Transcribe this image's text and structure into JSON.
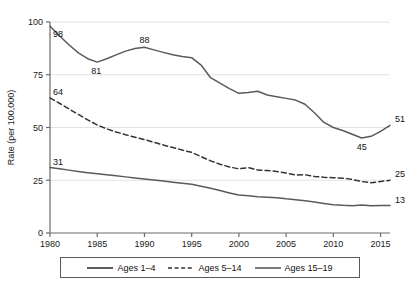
{
  "chart_data": {
    "type": "line",
    "title": "",
    "xlabel": "",
    "ylabel": "Rate (per 100,000)",
    "xlim": [
      1980,
      2016
    ],
    "ylim": [
      0,
      100
    ],
    "grid": true,
    "legend_position": "bottom",
    "x_ticks": [
      "1980",
      "1985",
      "1990",
      "1995",
      "2000",
      "2005",
      "2010",
      "2015"
    ],
    "x_tick_values": [
      1980,
      1985,
      1990,
      1995,
      2000,
      2005,
      2010,
      2015
    ],
    "y_ticks": [
      "0",
      "25",
      "50",
      "75",
      "100"
    ],
    "y_tick_values": [
      0,
      25,
      50,
      75,
      100
    ],
    "x": [
      1980,
      1981,
      1982,
      1983,
      1984,
      1985,
      1986,
      1987,
      1988,
      1989,
      1990,
      1991,
      1992,
      1993,
      1994,
      1995,
      1996,
      1997,
      1998,
      1999,
      2000,
      2001,
      2002,
      2003,
      2004,
      2005,
      2006,
      2007,
      2008,
      2009,
      2010,
      2011,
      2012,
      2013,
      2014,
      2015,
      2016
    ],
    "series": [
      {
        "name": "Ages 1–4",
        "style": "solid",
        "color": "#5a5a5a",
        "values": [
          31,
          30.4,
          29.8,
          29.2,
          28.6,
          28.1,
          27.6,
          27.1,
          26.6,
          26.1,
          25.6,
          25.1,
          24.6,
          24.1,
          23.6,
          23.1,
          22.2,
          21.2,
          20.1,
          19.0,
          18.0,
          17.7,
          17.2,
          17.0,
          16.7,
          16.2,
          15.8,
          15.3,
          14.7,
          14.0,
          13.4,
          13.1,
          12.9,
          13.3,
          12.9,
          13.0,
          13
        ]
      },
      {
        "name": "Ages 5–14",
        "style": "dashed",
        "color": "#333333",
        "values": [
          64,
          61.5,
          58.8,
          56.2,
          53.6,
          51.2,
          49.4,
          47.9,
          46.6,
          45.4,
          44.3,
          43.0,
          41.7,
          40.5,
          39.3,
          38.2,
          36.2,
          34.2,
          32.6,
          31.3,
          30.4,
          31.0,
          29.8,
          29.6,
          29.2,
          28.4,
          27.5,
          27.6,
          26.8,
          26.4,
          26.2,
          26.0,
          25.4,
          24.4,
          23.8,
          24.4,
          25
        ]
      },
      {
        "name": "Ages 15–19",
        "style": "solid",
        "color": "#5a5a5a",
        "values": [
          98,
          93.5,
          89.2,
          85.4,
          82.6,
          81,
          82.6,
          84.4,
          86.2,
          87.4,
          88,
          86.8,
          85.6,
          84.5,
          83.6,
          83.1,
          79.6,
          73.6,
          71.0,
          68.4,
          66.2,
          66.6,
          67.2,
          65.4,
          64.6,
          63.8,
          63.0,
          61.0,
          57.0,
          52.4,
          50.0,
          48.6,
          46.8,
          45,
          45.8,
          48.2,
          51
        ]
      }
    ],
    "point_labels": [
      {
        "text": "98",
        "x": 1980,
        "y": 98,
        "anchor": "below-right"
      },
      {
        "text": "81",
        "x": 1985,
        "y": 81,
        "anchor": "below-left"
      },
      {
        "text": "88",
        "x": 1990,
        "y": 88,
        "anchor": "above"
      },
      {
        "text": "45",
        "x": 2013,
        "y": 45,
        "anchor": "below"
      },
      {
        "text": "51",
        "x": 2016,
        "y": 51,
        "anchor": "right-above"
      },
      {
        "text": "64",
        "x": 1980,
        "y": 64,
        "anchor": "above-right"
      },
      {
        "text": "25",
        "x": 2016,
        "y": 25,
        "anchor": "right-above"
      },
      {
        "text": "31",
        "x": 1980,
        "y": 31,
        "anchor": "above-right"
      },
      {
        "text": "13",
        "x": 2016,
        "y": 13,
        "anchor": "right-above"
      }
    ]
  },
  "legend": {
    "entries": [
      {
        "label": "Ages 1–4",
        "style": "solid",
        "color": "#333333"
      },
      {
        "label": "Ages 5–14",
        "style": "dashed",
        "color": "#333333"
      },
      {
        "label": "Ages 15–19",
        "style": "solid",
        "color": "#5a5a5a"
      }
    ]
  }
}
